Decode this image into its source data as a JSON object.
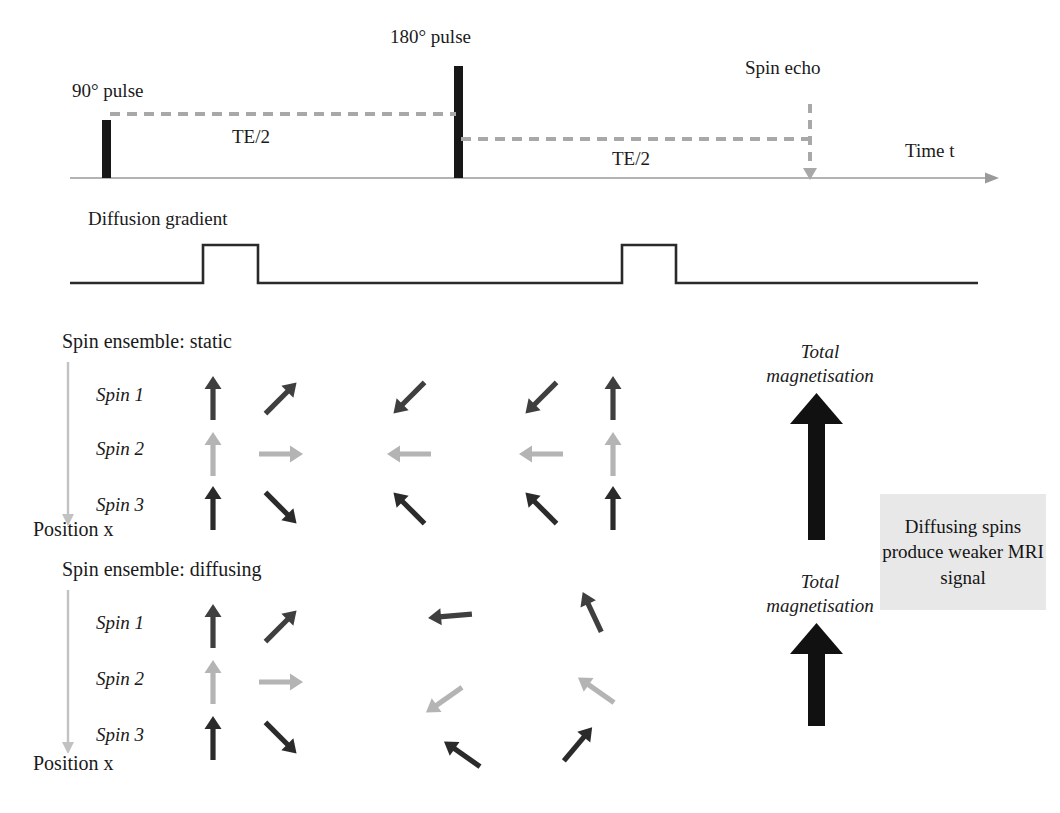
{
  "figure": {
    "type": "mri-pulse-sequence-diagram"
  },
  "timeline": {
    "axis_label": "Time t",
    "pulse_90_label": "90° pulse",
    "pulse_180_label": "180° pulse",
    "spin_echo_label": "Spin echo",
    "te_left_label": "TE/2",
    "te_right_label": "TE/2",
    "axis_color": "#9a9a9a",
    "pulse_color": "#171717",
    "dash_color": "#a8a8a8"
  },
  "gradient": {
    "label": "Diffusion gradient",
    "line_color": "#2a2a2a",
    "lobes": 2
  },
  "ensembles": [
    {
      "id": "static",
      "title": "Spin ensemble: static",
      "position_label": "Position x",
      "spin_labels": [
        "Spin 1",
        "Spin 2",
        "Spin 3"
      ],
      "total_label_line1": "Total",
      "total_label_line2": "magnetisation",
      "total_strength": "full",
      "columns": [
        {
          "name": "initial",
          "angles": [
            0,
            0,
            0
          ]
        },
        {
          "name": "dephase-1",
          "angles": [
            45,
            90,
            135
          ]
        },
        {
          "name": "after-180",
          "angles": [
            -135,
            -90,
            -45
          ]
        },
        {
          "name": "dephase-2",
          "angles": [
            -135,
            -90,
            -45
          ]
        },
        {
          "name": "rephased",
          "angles": [
            0,
            0,
            0
          ]
        }
      ]
    },
    {
      "id": "diffusing",
      "title": "Spin ensemble: diffusing",
      "position_label": "Position x",
      "spin_labels": [
        "Spin 1",
        "Spin 2",
        "Spin 3"
      ],
      "total_label_line1": "Total",
      "total_label_line2": "magnetisation",
      "total_strength": "reduced",
      "columns": [
        {
          "name": "initial",
          "angles": [
            0,
            0,
            0
          ]
        },
        {
          "name": "dephase-1",
          "angles": [
            45,
            90,
            135
          ]
        },
        {
          "name": "after-180",
          "angles": [
            -95,
            -125,
            -55
          ]
        },
        {
          "name": "not-rephased",
          "angles": [
            -25,
            -55,
            40
          ]
        }
      ]
    }
  ],
  "spin_colors": [
    "#3f3f3f",
    "#b4b4b4",
    "#2b2b2b"
  ],
  "total_arrow_color": "#111111",
  "position_arrow_color": "#c2c2c2",
  "note": {
    "text": "Diffusing spins produce weaker MRI signal",
    "background": "#e8e8e8"
  }
}
